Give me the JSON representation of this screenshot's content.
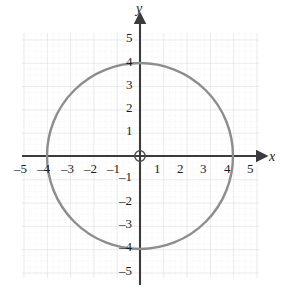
{
  "figure": {
    "background_color": "#ffffff",
    "axis_color": "#3b3b3b",
    "curve_color": "#8d8d8d",
    "grid_major_color": "#e2e2e2",
    "grid_minor_color": "#dedede",
    "label_color": "#1d1d1d",
    "x_axis_name": "x",
    "y_axis_name": "y",
    "origin_marker": "origin-circle"
  },
  "chart_data": {
    "type": "line",
    "title": "",
    "subtitle": "",
    "xlabel": "x",
    "ylabel": "y",
    "xlim": [
      -5.5,
      5.5
    ],
    "ylim": [
      -5.5,
      5.5
    ],
    "grid": true,
    "grid_major_step": 1,
    "grid_minor_step": 0.25,
    "legend": "none",
    "x_ticks": [
      -5,
      -4,
      -3,
      -2,
      -1,
      1,
      2,
      3,
      4,
      5
    ],
    "y_ticks": [
      5,
      4,
      3,
      2,
      1,
      -1,
      -2,
      -3,
      -4,
      -5
    ],
    "x_tick_labels": [
      "–5",
      "–4",
      "–3",
      "–2",
      "–1",
      "1",
      "2",
      "3",
      "4",
      "5"
    ],
    "y_tick_labels": [
      "5",
      "4",
      "3",
      "2",
      "1",
      "–1",
      "–2",
      "–3",
      "–4",
      "–5"
    ],
    "series": [
      {
        "name": "circle",
        "shape": "circle",
        "center": [
          0,
          0
        ],
        "radius": 4,
        "equation": "x^2 + y^2 = 16",
        "intercepts": [
          [
            -4,
            0
          ],
          [
            4,
            0
          ],
          [
            0,
            4
          ],
          [
            0,
            -4
          ]
        ]
      }
    ],
    "annotations": []
  },
  "x_ticks": [
    {
      "label": "–5",
      "left": 14,
      "top": 162
    },
    {
      "label": "–4",
      "left": 37,
      "top": 162
    },
    {
      "label": "–3",
      "left": 61,
      "top": 162
    },
    {
      "label": "–2",
      "left": 84,
      "top": 162
    },
    {
      "label": "–1",
      "left": 107,
      "top": 162
    },
    {
      "label": "1",
      "left": 154,
      "top": 162
    },
    {
      "label": "2",
      "left": 177,
      "top": 162
    },
    {
      "label": "3",
      "left": 200,
      "top": 162
    },
    {
      "label": "4",
      "left": 224,
      "top": 162
    },
    {
      "label": "5",
      "left": 247,
      "top": 162
    }
  ],
  "y_ticks": [
    {
      "label": "5",
      "left": 126,
      "top": 31
    },
    {
      "label": "4",
      "left": 126,
      "top": 55
    },
    {
      "label": "3",
      "left": 126,
      "top": 78
    },
    {
      "label": "2",
      "left": 126,
      "top": 101
    },
    {
      "label": "1",
      "left": 126,
      "top": 124
    },
    {
      "label": "–1",
      "left": 119,
      "top": 170
    },
    {
      "label": "–2",
      "left": 119,
      "top": 194
    },
    {
      "label": "–3",
      "left": 119,
      "top": 217
    },
    {
      "label": "–4",
      "left": 119,
      "top": 240
    },
    {
      "label": "–5",
      "left": 119,
      "top": 264
    }
  ],
  "axis_names": {
    "x": {
      "label": "x",
      "left": 269,
      "top": 150
    },
    "y": {
      "label": "y",
      "left": 136,
      "top": 2
    }
  }
}
